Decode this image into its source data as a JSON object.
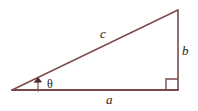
{
  "figure": {
    "name": "right-triangle-diagram",
    "background_color": "#ffffff",
    "stroke_color": "#7a4a4a",
    "text_color": "#1c1c1c",
    "width": 198,
    "height": 111
  },
  "diagram_data": {
    "type": "geometry-diagram",
    "shape": "right triangle",
    "vertices": {
      "left": [
        12,
        90
      ],
      "bottom_right": [
        178,
        90
      ],
      "top_right": [
        178,
        10
      ]
    },
    "sides": [
      {
        "name": "hypotenuse",
        "label": "c",
        "from": "left",
        "to": "top_right"
      },
      {
        "name": "opposite",
        "label": "b",
        "from": "top_right",
        "to": "bottom_right"
      },
      {
        "name": "adjacent",
        "label": "a",
        "from": "left",
        "to": "bottom_right"
      }
    ],
    "angles": [
      {
        "name": "theta",
        "label": "θ",
        "at": "left",
        "marker": "arrow"
      },
      {
        "name": "right-angle",
        "label": "",
        "at": "bottom_right",
        "marker": "square"
      }
    ]
  },
  "labels": {
    "hypotenuse": "c",
    "opposite": "b",
    "adjacent": "a",
    "angle": "θ"
  }
}
